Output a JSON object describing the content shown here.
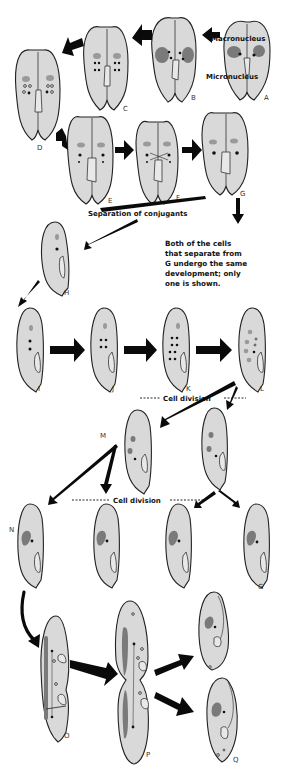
{
  "labels": {
    "macronucleus": "Macronucleus",
    "micronucleus": "Micronucleus",
    "separation": "Separation of conjugants",
    "cell_division_1": "Cell division",
    "cell_division_2": "Cell division"
  },
  "note": {
    "line1": "Both of the cells",
    "line2": "that separate from",
    "line3": "G  undergo the same",
    "line4": "development; only",
    "line5": "one is shown."
  },
  "stages": {
    "A": "A",
    "B": "B",
    "C": "C",
    "D": "D",
    "E": "E",
    "F": "F",
    "G": "G",
    "H": "H",
    "I": "I",
    "J": "J",
    "K": "K",
    "L": "L",
    "M": "M",
    "N": "N",
    "N4": "G",
    "O": "O",
    "P": "P",
    "Q": "Q"
  },
  "colors": {
    "cell_fill": "#d9d9d9",
    "macronucleus": "#7a7a7a",
    "arrow": "#0a0a0a",
    "background": "#ffffff"
  }
}
